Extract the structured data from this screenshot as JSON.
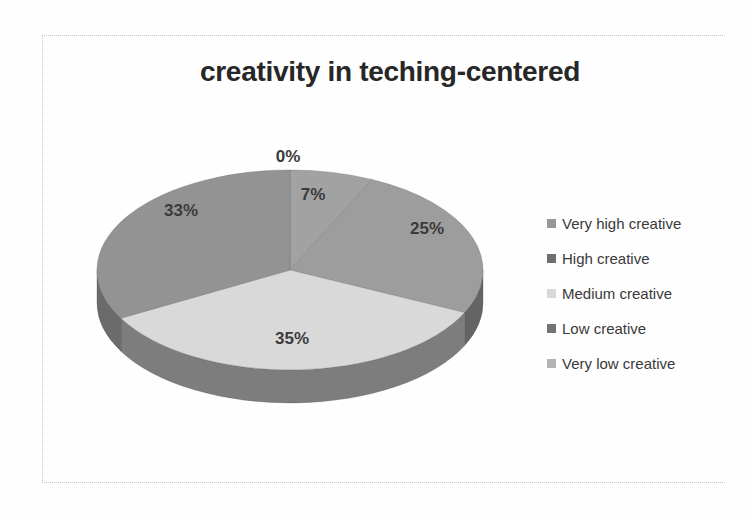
{
  "chart_data": {
    "type": "pie",
    "title": "creativity in teching-centered",
    "effect": "3d",
    "direction": "clockwise",
    "start_angle_deg": 0,
    "legend_position": "right",
    "unit": "%",
    "categories": [
      "Very high creative",
      "High creative",
      "Medium creative",
      "Low creative",
      "Very low creative"
    ],
    "values": [
      0,
      7,
      25,
      35,
      33
    ],
    "slices": [
      {
        "name": "Very high creative",
        "value": 0,
        "label": "0%",
        "color": "#a9a9a9",
        "side_color": "#777777",
        "legend_marker_color": "#979797"
      },
      {
        "name": "High creative",
        "value": 7,
        "label": "7%",
        "color": "#a2a2a2",
        "side_color": "#6f6f6f",
        "legend_marker_color": "#6f6f6f"
      },
      {
        "name": "Medium creative",
        "value": 25,
        "label": "25%",
        "color": "#9d9d9d",
        "side_color": "#646464",
        "legend_marker_color": "#d8d8d8"
      },
      {
        "name": "Low creative",
        "value": 35,
        "label": "35%",
        "color": "#d9d9d9",
        "side_color": "#7d7d7d",
        "legend_marker_color": "#747474"
      },
      {
        "name": "Very low creative",
        "value": 33,
        "label": "33%",
        "color": "#939393",
        "side_color": "#6b6b6b",
        "legend_marker_color": "#b4b4b4"
      }
    ],
    "colors": {
      "title_text": "#272727",
      "slice_label_text": "#3b3b3b",
      "legend_text": "#3a3a3a",
      "frame_border": "#c7c7c7"
    }
  }
}
